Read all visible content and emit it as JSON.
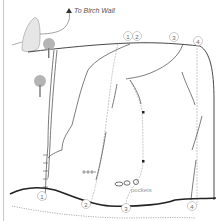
{
  "diagram": {
    "direction_label": "To Birch Wall",
    "pockets_label": "pockets",
    "routes_top": [
      {
        "id": "1",
        "label": "1"
      },
      {
        "id": "2",
        "label": "2"
      },
      {
        "id": "3",
        "label": "3"
      },
      {
        "id": "4",
        "label": "4"
      }
    ],
    "routes_bottom": [
      {
        "id": "1",
        "label": "1"
      },
      {
        "id": "2",
        "label": "2"
      },
      {
        "id": "3",
        "label": "3"
      },
      {
        "id": "4",
        "label": "4"
      }
    ],
    "colors": {
      "line": "#333333",
      "route": "#bbbbbb",
      "rock": "#e6e6e6",
      "tree": "#b4b4b4"
    }
  }
}
